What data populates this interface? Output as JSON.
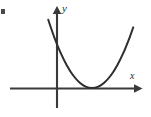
{
  "figure": {
    "width": 151,
    "height": 117,
    "background_color": "#ffffff",
    "ink_color": "#3a3a3a",
    "curve_color": "#2e2e2e"
  },
  "axes": {
    "x_label": "x",
    "y_label": "y",
    "x_axis": {
      "y_pixel": 88,
      "x_start": 10,
      "x_end": 141,
      "arrow": "right-arrowhead"
    },
    "y_axis": {
      "x_pixel": 57,
      "y_start": 7,
      "y_end": 108,
      "arrow": "up-arrowhead"
    },
    "origin": {
      "x": 57,
      "y": 88
    },
    "ticks": [],
    "gridlines": false
  },
  "chart_data": {
    "type": "line",
    "title": "",
    "subtitle": "",
    "xlabel": "x",
    "ylabel": "y",
    "grid": false,
    "legend": null,
    "axis_arrows": {
      "x": "right",
      "y": "up"
    },
    "xlim": [
      -2.4,
      3.0
    ],
    "ylim": [
      -0.6,
      4.7
    ],
    "series": [
      {
        "name": "parabola",
        "kind": "quadratic",
        "equation": "y = (x - 1.4)^2",
        "vertex": {
          "x": 1.4,
          "y": 0
        },
        "opens": "up",
        "tangent_to_x_axis": true,
        "x": [
          -0.35,
          -0.1,
          0.15,
          0.4,
          0.65,
          0.9,
          1.15,
          1.4,
          1.65,
          1.9,
          2.15,
          2.4,
          2.65,
          2.9,
          3.05
        ],
        "values": [
          3.06,
          2.25,
          1.56,
          1.0,
          0.56,
          0.25,
          0.06,
          0.0,
          0.06,
          0.25,
          0.56,
          1.0,
          1.56,
          2.25,
          2.72
        ]
      }
    ],
    "annotations": [
      {
        "text": "x",
        "role": "x-axis-label",
        "italic": true
      },
      {
        "text": "y",
        "role": "y-axis-label",
        "italic": true
      }
    ]
  },
  "artifacts": {
    "left_edge_mark": {
      "description": "small dark fragment clipped at left edge",
      "x": 1,
      "y": 9,
      "width": 4,
      "height": 5
    }
  }
}
